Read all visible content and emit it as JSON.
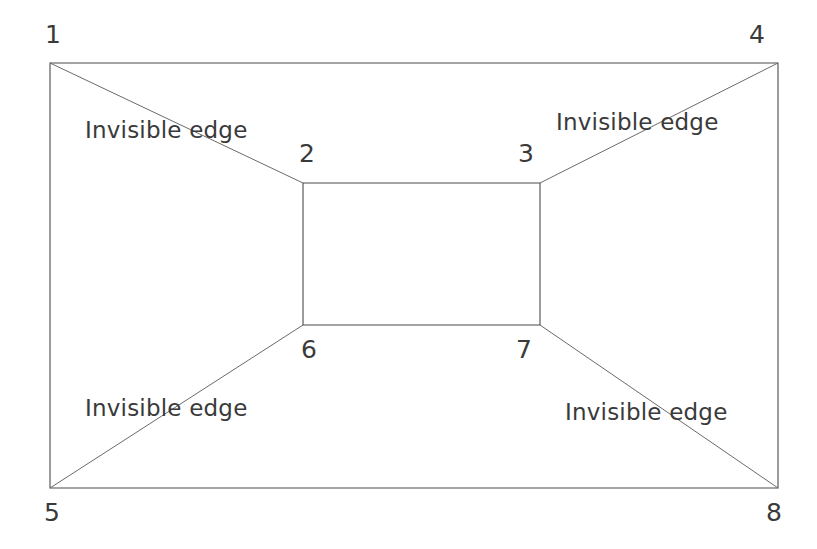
{
  "figure": {
    "background_color": "#ffffff",
    "line_color": "#4c4c4c",
    "diagonal_color": "#6a6a6a",
    "text_color": "#3a3a3a",
    "width": 817,
    "height": 549
  },
  "outer_rectangle": {
    "name": "outer-face",
    "left": 50,
    "top": 63,
    "right": 778,
    "bottom": 488
  },
  "inner_rectangle": {
    "name": "inner-face",
    "left": 303,
    "top": 183,
    "right": 540,
    "bottom": 325
  },
  "vertices": [
    {
      "id": "1",
      "label": "1",
      "x": 50,
      "y": 63,
      "label_x": 45,
      "label_y": 22,
      "corner": "top-left-outer"
    },
    {
      "id": "2",
      "label": "2",
      "x": 303,
      "y": 183,
      "label_x": 299,
      "label_y": 141,
      "corner": "top-left-inner"
    },
    {
      "id": "3",
      "label": "3",
      "x": 540,
      "y": 183,
      "label_x": 518,
      "label_y": 141,
      "corner": "top-right-inner"
    },
    {
      "id": "4",
      "label": "4",
      "x": 778,
      "y": 63,
      "label_x": 749,
      "label_y": 22,
      "corner": "top-right-outer"
    },
    {
      "id": "5",
      "label": "5",
      "x": 50,
      "y": 488,
      "label_x": 44,
      "label_y": 500,
      "corner": "bottom-left-outer"
    },
    {
      "id": "6",
      "label": "6",
      "x": 303,
      "y": 325,
      "label_x": 301,
      "label_y": 337,
      "corner": "bottom-left-inner"
    },
    {
      "id": "7",
      "label": "7",
      "x": 540,
      "y": 325,
      "label_x": 516,
      "label_y": 337,
      "corner": "bottom-right-inner"
    },
    {
      "id": "8",
      "label": "8",
      "x": 778,
      "y": 488,
      "label_x": 766,
      "label_y": 500,
      "corner": "bottom-right-outer"
    }
  ],
  "diagonals": [
    {
      "name": "diagonal-1-2",
      "from": "1",
      "to": "2",
      "x1": 50,
      "y1": 63,
      "x2": 303,
      "y2": 183
    },
    {
      "name": "diagonal-4-3",
      "from": "4",
      "to": "3",
      "x1": 778,
      "y1": 63,
      "x2": 540,
      "y2": 183
    },
    {
      "name": "diagonal-5-6",
      "from": "5",
      "to": "6",
      "x1": 50,
      "y1": 488,
      "x2": 303,
      "y2": 325
    },
    {
      "name": "diagonal-8-7",
      "from": "8",
      "to": "7",
      "x1": 778,
      "y1": 488,
      "x2": 540,
      "y2": 325
    }
  ],
  "edge_labels": [
    {
      "name": "edge-label-top-left",
      "text": "Invisible edge",
      "x": 85,
      "y": 119
    },
    {
      "name": "edge-label-top-right",
      "text": "Invisible edge",
      "x": 556,
      "y": 111
    },
    {
      "name": "edge-label-bottom-left",
      "text": "Invisible edge",
      "x": 85,
      "y": 397
    },
    {
      "name": "edge-label-bottom-right",
      "text": "Invisible edge",
      "x": 565,
      "y": 401
    }
  ]
}
